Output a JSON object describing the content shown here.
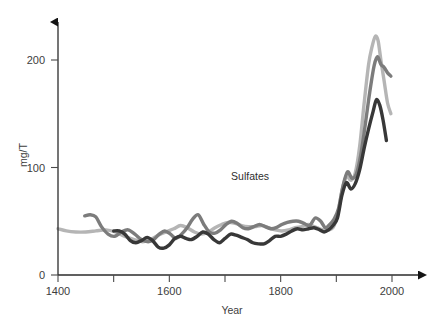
{
  "chart_data": {
    "type": "line",
    "title": "",
    "subtitle": "",
    "xlabel": "Year",
    "ylabel": "mg/T",
    "xlim": [
      1400,
      2010
    ],
    "ylim": [
      0,
      235
    ],
    "grid": false,
    "legend_position": "none",
    "annotations": [
      {
        "text": "Sulfates",
        "x": 1745,
        "y": 88
      }
    ],
    "xticks": [
      1400,
      1500,
      1600,
      1700,
      1800,
      1900,
      2000
    ],
    "xtick_labels": [
      "1400",
      "",
      "1600",
      "",
      "1800",
      "",
      "2000"
    ],
    "yticks": [
      0,
      100,
      200
    ],
    "ytick_labels": [
      "0",
      "100",
      "200"
    ],
    "series": [
      {
        "name": "light-gray-core",
        "color": "#b5b5b5",
        "width": 3.4,
        "x": [
          1400,
          1415,
          1432,
          1450,
          1468,
          1486,
          1503,
          1520,
          1537,
          1552,
          1566,
          1580,
          1594,
          1608,
          1620,
          1632,
          1645,
          1658,
          1670,
          1682,
          1694,
          1706,
          1718,
          1730,
          1742,
          1754,
          1766,
          1778,
          1790,
          1802,
          1814,
          1826,
          1838,
          1850,
          1860,
          1870,
          1878,
          1886,
          1894,
          1902,
          1910,
          1918,
          1926,
          1934,
          1942,
          1950,
          1958,
          1964,
          1970,
          1975,
          1980,
          1986,
          1992,
          1998
        ],
        "values": [
          43,
          41,
          40,
          40,
          41,
          42,
          40,
          36,
          33,
          31,
          33,
          37,
          40,
          43,
          46,
          44,
          40,
          38,
          40,
          44,
          47,
          49,
          48,
          46,
          45,
          45,
          46,
          44,
          42,
          41,
          42,
          44,
          45,
          47,
          45,
          43,
          42,
          42,
          44,
          55,
          78,
          92,
          88,
          95,
          120,
          160,
          196,
          212,
          222,
          218,
          200,
          180,
          160,
          150
        ]
      },
      {
        "name": "medium-gray-core",
        "color": "#7c7c7c",
        "width": 3.4,
        "x": [
          1448,
          1458,
          1468,
          1478,
          1490,
          1502,
          1514,
          1526,
          1538,
          1550,
          1562,
          1572,
          1582,
          1592,
          1602,
          1612,
          1622,
          1632,
          1642,
          1652,
          1662,
          1672,
          1682,
          1692,
          1702,
          1712,
          1722,
          1732,
          1742,
          1752,
          1762,
          1772,
          1782,
          1792,
          1802,
          1812,
          1822,
          1832,
          1842,
          1852,
          1862,
          1872,
          1880,
          1888,
          1896,
          1904,
          1912,
          1920,
          1928,
          1936,
          1944,
          1952,
          1960,
          1968,
          1974,
          1980,
          1986,
          1992,
          1998
        ],
        "values": [
          55,
          56,
          54,
          45,
          38,
          36,
          40,
          42,
          38,
          33,
          31,
          33,
          38,
          41,
          38,
          34,
          38,
          44,
          52,
          56,
          47,
          40,
          39,
          42,
          47,
          50,
          48,
          44,
          43,
          45,
          47,
          45,
          43,
          44,
          47,
          49,
          50,
          50,
          48,
          46,
          53,
          50,
          44,
          47,
          52,
          62,
          83,
          96,
          90,
          94,
          112,
          140,
          170,
          195,
          203,
          196,
          193,
          188,
          185
        ]
      },
      {
        "name": "dark-core",
        "color": "#383838",
        "width": 3.4,
        "x": [
          1500,
          1510,
          1520,
          1530,
          1540,
          1550,
          1560,
          1570,
          1580,
          1590,
          1600,
          1610,
          1620,
          1630,
          1640,
          1650,
          1660,
          1670,
          1680,
          1690,
          1700,
          1710,
          1720,
          1730,
          1740,
          1750,
          1760,
          1770,
          1780,
          1790,
          1800,
          1810,
          1820,
          1830,
          1840,
          1850,
          1860,
          1870,
          1878,
          1886,
          1894,
          1902,
          1910,
          1918,
          1926,
          1934,
          1942,
          1950,
          1958,
          1966,
          1972,
          1978,
          1984,
          1990
        ],
        "values": [
          41,
          41,
          38,
          32,
          30,
          32,
          35,
          32,
          26,
          25,
          28,
          34,
          36,
          34,
          33,
          36,
          40,
          38,
          33,
          30,
          34,
          38,
          37,
          35,
          33,
          30,
          29,
          29,
          32,
          36,
          36,
          38,
          41,
          43,
          42,
          43,
          44,
          42,
          40,
          42,
          46,
          53,
          74,
          86,
          80,
          85,
          98,
          118,
          136,
          152,
          163,
          158,
          144,
          125
        ]
      }
    ]
  },
  "axes": {
    "y_arrow": true,
    "x_arrow": true
  }
}
